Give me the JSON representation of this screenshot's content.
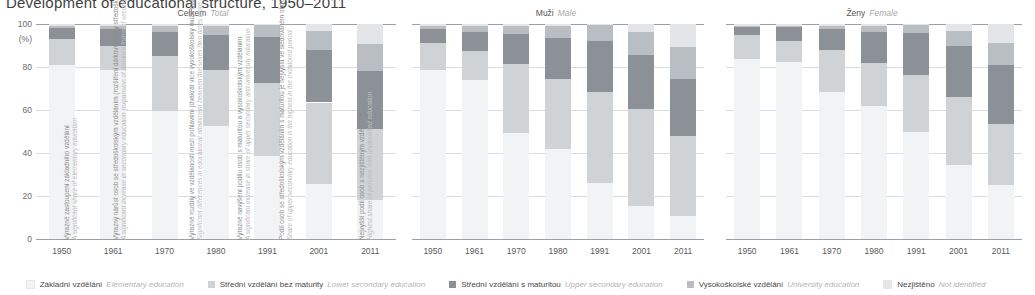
{
  "title": "Development of educational structure, 1950–2011",
  "axis": {
    "unit": "(%)",
    "yticks": [
      100,
      80,
      60,
      40,
      20,
      0
    ],
    "ymin": 0,
    "ymax": 100,
    "categories": [
      "1950",
      "1961",
      "1970",
      "1980",
      "1991",
      "2001",
      "2011"
    ]
  },
  "legend": [
    {
      "cz": "Základní vzdělání",
      "en": "Elementary education",
      "color": "#f2f3f4"
    },
    {
      "cz": "Střední vzdělání bez maturity",
      "en": "Lower secondary education",
      "color": "#cfd3d6"
    },
    {
      "cz": "Střední vzdělání s maturitou",
      "en": "Upper secondary education",
      "color": "#8c9197"
    },
    {
      "cz": "Vysokoškolské vzdělání",
      "en": "University education",
      "color": "#b9bec2"
    },
    {
      "cz": "Nezjištěno",
      "en": "Not identified",
      "color": "#e3e5e7"
    }
  ],
  "panels": [
    {
      "id": "total",
      "cz": "Celkem",
      "en": "Total"
    },
    {
      "id": "male",
      "cz": "Muži",
      "en": "Male"
    },
    {
      "id": "female",
      "cz": "Ženy",
      "en": "Female"
    }
  ],
  "annotations": [
    {
      "cz": "Výrazné zastoupení základního vzdělání",
      "en": "A significant share of elementary education"
    },
    {
      "cz": "Výrazný nárůst osob se středoškolským vzděláním (rozšíření dálkové formy středoškolského i vysokoškolského studia)",
      "en": "A significant increase in secondary education (expansion of distance forms of secondary and university studies)"
    },
    {
      "cz": "Výrazné rozdíly ve vzdělanosti mezi pohlavími (dvakrát více vysokoškolsky mužů než žen)",
      "en": "Significant differences in educational attainment between the sexes (two times more university educated men than women)"
    },
    {
      "cz": "Výrazné navýšení podílu osob s maturitou a vysokoškolským vzděláním",
      "en": "A significant increase in share of upper secondary and university education"
    },
    {
      "cz": "Podíl osob se středoškolským vzděláním s maturitou je nejvyšší ve sledovaném období",
      "en": "Share of upper secondary education is the highest in the monitored period"
    },
    {
      "cz": "Nejvyšší podíl osob s nezjištěným vzděláním",
      "en": "Highest share of persons with unidentified education"
    }
  ],
  "chart_data": {
    "type": "bar",
    "stacked": true,
    "title": "Development of educational structure, 1950–2011",
    "xlabel": "",
    "ylabel": "(%)",
    "ylim": [
      0,
      100
    ],
    "grid": true,
    "legend_position": "bottom",
    "categories": [
      "1950",
      "1961",
      "1970",
      "1980",
      "1991",
      "2001",
      "2011"
    ],
    "series_names": [
      "Základní vzdělání / Elementary education",
      "Střední vzdělání bez maturity / Lower secondary education",
      "Střední vzdělání s maturitou / Upper secondary education",
      "Vysokoškolské vzdělání / University education",
      "Nezjištěno / Not identified"
    ],
    "panels": [
      {
        "name": "Celkem / Total",
        "series": [
          {
            "name": "Základní vzdělání",
            "values": [
              81.0,
              78.5,
              59.5,
              52.5,
              38.5,
              25.5,
              18.0
            ]
          },
          {
            "name": "Střední vzdělání bez maturity",
            "values": [
              12.0,
              11.5,
              25.5,
              26.0,
              34.0,
              38.0,
              33.0
            ]
          },
          {
            "name": "Střední vzdělání s maturitou",
            "values": [
              5.0,
              7.5,
              11.5,
              16.5,
              21.5,
              24.5,
              27.0
            ]
          },
          {
            "name": "Vysokoškolské vzdělání",
            "values": [
              1.0,
              1.7,
              2.8,
              4.0,
              5.5,
              8.9,
              12.5
            ]
          },
          {
            "name": "Nezjištěno",
            "values": [
              1.0,
              0.8,
              0.7,
              1.0,
              0.5,
              3.1,
              9.5
            ]
          }
        ]
      },
      {
        "name": "Muži / Male",
        "series": [
          {
            "name": "Základní vzdělání",
            "values": [
              78.5,
              74.0,
              49.5,
              42.0,
              26.0,
              15.5,
              10.5
            ]
          },
          {
            "name": "Střední vzdělání bez maturity",
            "values": [
              12.5,
              13.5,
              32.0,
              32.5,
              42.5,
              45.0,
              37.5
            ]
          },
          {
            "name": "Střední vzdělání s maturitou",
            "values": [
              6.5,
              9.0,
              14.0,
              19.0,
              23.5,
              25.0,
              26.5
            ]
          },
          {
            "name": "Vysokoškolské vzdělání",
            "values": [
              1.5,
              2.7,
              3.8,
              5.5,
              7.5,
              11.0,
              15.0
            ]
          },
          {
            "name": "Nezjištěno",
            "values": [
              1.0,
              0.8,
              0.7,
              1.0,
              0.5,
              3.5,
              10.5
            ]
          }
        ]
      },
      {
        "name": "Ženy / Female",
        "series": [
          {
            "name": "Základní vzdělání",
            "values": [
              83.5,
              82.5,
              68.5,
              62.0,
              50.0,
              34.5,
              25.0
            ]
          },
          {
            "name": "Střední vzdělání bez maturity",
            "values": [
              11.5,
              9.5,
              19.5,
              20.0,
              26.5,
              31.5,
              28.5
            ]
          },
          {
            "name": "Střední vzdělání s maturitou",
            "values": [
              3.5,
              6.5,
              9.5,
              14.5,
              19.5,
              24.0,
              27.5
            ]
          },
          {
            "name": "Vysokoškolské vzdělání",
            "values": [
              0.5,
              0.7,
              1.8,
              2.5,
              3.5,
              6.8,
              10.0
            ]
          },
          {
            "name": "Nezjištěno",
            "values": [
              1.0,
              0.8,
              0.7,
              1.0,
              0.5,
              3.2,
              9.0
            ]
          }
        ]
      }
    ]
  }
}
